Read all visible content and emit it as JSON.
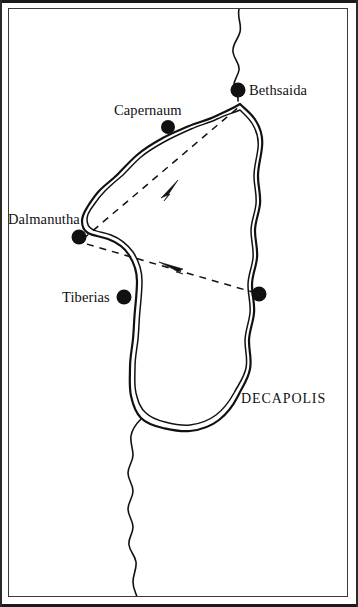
{
  "figure": {
    "kind": "historical-map",
    "background_color": "#ffffff",
    "ink_color": "#111111",
    "frame_color": "#3a3a3a"
  },
  "places": [
    {
      "id": "bethsaida",
      "label": "Bethsaida",
      "marker": {
        "x": 238,
        "y": 90,
        "r": 7.5
      },
      "label_pos": {
        "x": 249,
        "y": 83
      },
      "label_align": "left"
    },
    {
      "id": "capernaum",
      "label": "Capernaum",
      "marker": {
        "x": 168,
        "y": 127,
        "r": 7
      },
      "label_pos": {
        "x": 114,
        "y": 103
      },
      "label_align": "left"
    },
    {
      "id": "dalmanutha",
      "label": "Dalmanutha",
      "marker": {
        "x": 79,
        "y": 237,
        "r": 7.5
      },
      "label_pos": {
        "x": 8,
        "y": 212
      },
      "label_align": "left"
    },
    {
      "id": "tiberias",
      "label": "Tiberias",
      "marker": {
        "x": 124,
        "y": 297,
        "r": 7.5
      },
      "label_pos": {
        "x": 62,
        "y": 290
      },
      "label_align": "left"
    },
    {
      "id": "eastern-shore-site",
      "label": "",
      "marker": {
        "x": 259,
        "y": 294,
        "r": 7.5
      },
      "label_pos": null,
      "label_align": "left"
    }
  ],
  "regions": [
    {
      "id": "decapolis",
      "label": "DECAPOLIS",
      "label_pos": {
        "x": 241,
        "y": 392
      }
    }
  ],
  "routes": [
    {
      "id": "outbound-route",
      "style": "dashed",
      "from": "dalmanutha",
      "to": "bethsaida",
      "arrow_direction": "toward-bethsaida",
      "path": "M 83 239 L 240 106",
      "arrow_at": {
        "x": 170,
        "y": 188,
        "angle": -40
      }
    },
    {
      "id": "return-route",
      "style": "dashed",
      "from": "eastern-shore-site",
      "to": "dalmanutha",
      "arrow_direction": "toward-dalmanutha",
      "path": "M 256 293 L 83 243",
      "arrow_at": {
        "x": 172,
        "y": 267,
        "angle": 196
      }
    }
  ],
  "water_features": [
    {
      "id": "sea-of-galilee",
      "label": "",
      "outline_style": "double-line-shore"
    },
    {
      "id": "jordan-river-north",
      "label": "",
      "outline_style": "single-line"
    },
    {
      "id": "jordan-river-south",
      "label": "",
      "outline_style": "single-line"
    }
  ]
}
